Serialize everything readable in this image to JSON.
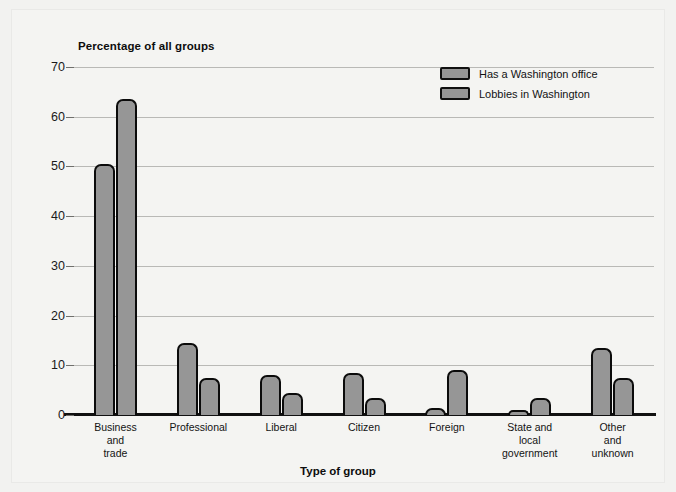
{
  "chart_data": {
    "type": "bar",
    "title": "Percentage of all groups",
    "xlabel": "Type of group",
    "ylabel": "Percentage of all groups",
    "ylim": [
      0,
      70
    ],
    "yticks": [
      0,
      10,
      20,
      30,
      40,
      50,
      60,
      70
    ],
    "grid": true,
    "legend_position": "top-right",
    "categories": [
      "Business and trade",
      "Professional",
      "Liberal",
      "Citizen",
      "Foreign",
      "State and local government",
      "Other and unknown"
    ],
    "category_lines": [
      [
        "Business",
        "and",
        "trade"
      ],
      [
        "Professional"
      ],
      [
        "Liberal"
      ],
      [
        "Citizen"
      ],
      [
        "Foreign"
      ],
      [
        "State and",
        "local",
        "government"
      ],
      [
        "Other",
        "and",
        "unknown"
      ]
    ],
    "series": [
      {
        "name": "Has a Washington office",
        "color": "#969696",
        "values": [
          50.5,
          14.5,
          8,
          8.5,
          1.5,
          1,
          13.5
        ]
      },
      {
        "name": "Lobbies in Washington",
        "color": "#969696",
        "values": [
          63.5,
          7.5,
          4.5,
          3.5,
          9,
          3.5,
          7.5
        ]
      }
    ]
  },
  "colors": {
    "bar_fill": "#969696",
    "bar_border": "#0b0b0b",
    "gridline": "#b9b9b6",
    "axis": "#111111",
    "background": "#f4f4f2",
    "text": "#121212"
  }
}
